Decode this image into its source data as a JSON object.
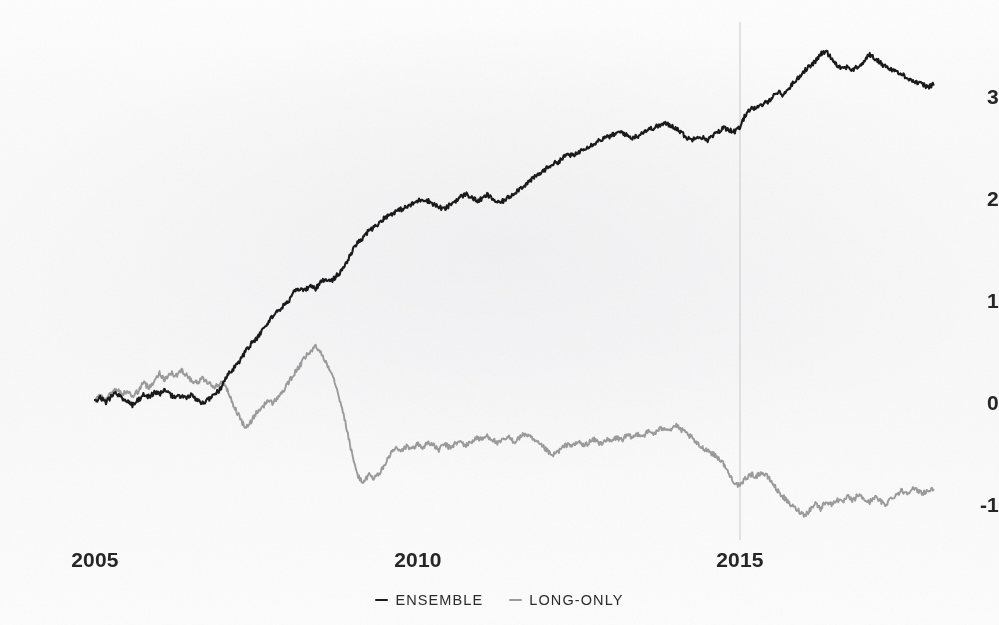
{
  "chart_data": {
    "type": "line",
    "title": "",
    "subtitle": "",
    "xlabel": "",
    "ylabel": "",
    "xlim": [
      2004.85,
      2018.05
    ],
    "ylim": [
      -1.35,
      3.62
    ],
    "grid": false,
    "legend_position": "bottom-center",
    "xticks": [
      2005,
      2010,
      2015
    ],
    "xticklabels": [
      "2005",
      "2010",
      "2015"
    ],
    "yticks": [
      -1,
      0,
      1,
      2,
      3
    ],
    "yticklabels": [
      "-1",
      "0",
      "1",
      "2",
      "3"
    ],
    "annotations": [
      {
        "type": "vline",
        "x": 2015,
        "label": "",
        "color": "#c9c9cf"
      }
    ],
    "colors": {
      "ensemble": "#1a1a1a",
      "long_only": "#9a9a9a",
      "vline": "#c9c9cf",
      "text": "#262626",
      "background": "#fafafa"
    },
    "series": [
      {
        "name": "ENSEMBLE",
        "color": "#1a1a1a",
        "x": [
          2005.0,
          2005.08,
          2005.17,
          2005.25,
          2005.33,
          2005.42,
          2005.5,
          2005.58,
          2005.67,
          2005.75,
          2005.83,
          2005.92,
          2006.0,
          2006.08,
          2006.17,
          2006.25,
          2006.33,
          2006.42,
          2006.5,
          2006.58,
          2006.67,
          2006.75,
          2006.83,
          2006.92,
          2007.0,
          2007.08,
          2007.17,
          2007.25,
          2007.33,
          2007.42,
          2007.5,
          2007.58,
          2007.67,
          2007.75,
          2007.83,
          2007.92,
          2008.0,
          2008.08,
          2008.17,
          2008.25,
          2008.33,
          2008.42,
          2008.5,
          2008.58,
          2008.67,
          2008.75,
          2008.83,
          2008.92,
          2009.0,
          2009.08,
          2009.17,
          2009.25,
          2009.33,
          2009.42,
          2009.5,
          2009.58,
          2009.67,
          2009.75,
          2009.83,
          2009.92,
          2010.0,
          2010.08,
          2010.17,
          2010.25,
          2010.33,
          2010.42,
          2010.5,
          2010.58,
          2010.67,
          2010.75,
          2010.83,
          2010.92,
          2011.0,
          2011.08,
          2011.17,
          2011.25,
          2011.33,
          2011.42,
          2011.5,
          2011.58,
          2011.67,
          2011.75,
          2011.83,
          2011.92,
          2012.0,
          2012.08,
          2012.17,
          2012.25,
          2012.33,
          2012.42,
          2012.5,
          2012.58,
          2012.67,
          2012.75,
          2012.83,
          2012.92,
          2013.0,
          2013.08,
          2013.17,
          2013.25,
          2013.33,
          2013.42,
          2013.5,
          2013.58,
          2013.67,
          2013.75,
          2013.83,
          2013.92,
          2014.0,
          2014.08,
          2014.17,
          2014.25,
          2014.33,
          2014.42,
          2014.5,
          2014.58,
          2014.67,
          2014.75,
          2014.83,
          2014.92,
          2015.0,
          2015.08,
          2015.17,
          2015.25,
          2015.33,
          2015.42,
          2015.5,
          2015.58,
          2015.67,
          2015.75,
          2015.83,
          2015.92,
          2016.0,
          2016.08,
          2016.17,
          2016.25,
          2016.33,
          2016.42,
          2016.5,
          2016.58,
          2016.67,
          2016.75,
          2016.83,
          2016.92,
          2017.0,
          2017.08,
          2017.17,
          2017.25,
          2017.33,
          2017.42,
          2017.5,
          2017.58,
          2017.67,
          2017.75,
          2017.83,
          2017.92,
          2018.0
        ],
        "y": [
          0.02,
          0.05,
          0.01,
          0.06,
          0.1,
          0.05,
          0.02,
          -0.02,
          0.03,
          0.08,
          0.06,
          0.1,
          0.09,
          0.12,
          0.08,
          0.05,
          0.07,
          0.05,
          0.08,
          0.02,
          0.0,
          0.03,
          0.08,
          0.12,
          0.2,
          0.3,
          0.35,
          0.42,
          0.5,
          0.58,
          0.62,
          0.7,
          0.78,
          0.85,
          0.9,
          0.95,
          1.0,
          1.08,
          1.12,
          1.1,
          1.15,
          1.12,
          1.18,
          1.22,
          1.2,
          1.25,
          1.3,
          1.4,
          1.5,
          1.58,
          1.62,
          1.7,
          1.72,
          1.78,
          1.82,
          1.85,
          1.88,
          1.9,
          1.92,
          1.95,
          1.98,
          2.0,
          1.98,
          1.95,
          1.92,
          1.9,
          1.94,
          1.98,
          2.02,
          2.05,
          2.02,
          1.98,
          2.0,
          2.04,
          2.0,
          1.96,
          1.98,
          2.02,
          2.06,
          2.1,
          2.14,
          2.18,
          2.22,
          2.26,
          2.3,
          2.34,
          2.36,
          2.4,
          2.44,
          2.42,
          2.46,
          2.5,
          2.52,
          2.55,
          2.58,
          2.6,
          2.62,
          2.64,
          2.66,
          2.62,
          2.6,
          2.62,
          2.66,
          2.68,
          2.7,
          2.72,
          2.74,
          2.72,
          2.7,
          2.66,
          2.6,
          2.58,
          2.62,
          2.6,
          2.58,
          2.62,
          2.66,
          2.7,
          2.68,
          2.66,
          2.7,
          2.82,
          2.9,
          2.88,
          2.92,
          2.95,
          3.0,
          3.05,
          3.02,
          3.08,
          3.14,
          3.2,
          3.26,
          3.3,
          3.35,
          3.42,
          3.45,
          3.38,
          3.32,
          3.28,
          3.3,
          3.26,
          3.3,
          3.34,
          3.42,
          3.38,
          3.34,
          3.3,
          3.28,
          3.25,
          3.22,
          3.2,
          3.16,
          3.14,
          3.12,
          3.1,
          3.12
        ]
      },
      {
        "name": "LONG-ONLY",
        "color": "#9a9a9a",
        "x": [
          2005.0,
          2005.08,
          2005.17,
          2005.25,
          2005.33,
          2005.42,
          2005.5,
          2005.58,
          2005.67,
          2005.75,
          2005.83,
          2005.92,
          2006.0,
          2006.08,
          2006.17,
          2006.25,
          2006.33,
          2006.42,
          2006.5,
          2006.58,
          2006.67,
          2006.75,
          2006.83,
          2006.92,
          2007.0,
          2007.08,
          2007.17,
          2007.25,
          2007.33,
          2007.42,
          2007.5,
          2007.58,
          2007.67,
          2007.75,
          2007.83,
          2007.92,
          2008.0,
          2008.08,
          2008.17,
          2008.25,
          2008.33,
          2008.42,
          2008.5,
          2008.58,
          2008.67,
          2008.75,
          2008.83,
          2008.92,
          2009.0,
          2009.08,
          2009.17,
          2009.25,
          2009.33,
          2009.42,
          2009.5,
          2009.58,
          2009.67,
          2009.75,
          2009.83,
          2009.92,
          2010.0,
          2010.08,
          2010.17,
          2010.25,
          2010.33,
          2010.42,
          2010.5,
          2010.58,
          2010.67,
          2010.75,
          2010.83,
          2010.92,
          2011.0,
          2011.08,
          2011.17,
          2011.25,
          2011.33,
          2011.42,
          2011.5,
          2011.58,
          2011.67,
          2011.75,
          2011.83,
          2011.92,
          2012.0,
          2012.08,
          2012.17,
          2012.25,
          2012.33,
          2012.42,
          2012.5,
          2012.58,
          2012.67,
          2012.75,
          2012.83,
          2012.92,
          2013.0,
          2013.08,
          2013.17,
          2013.25,
          2013.33,
          2013.42,
          2013.5,
          2013.58,
          2013.67,
          2013.75,
          2013.83,
          2013.92,
          2014.0,
          2014.08,
          2014.17,
          2014.25,
          2014.33,
          2014.42,
          2014.5,
          2014.58,
          2014.67,
          2014.75,
          2014.83,
          2014.92,
          2015.0,
          2015.08,
          2015.17,
          2015.25,
          2015.33,
          2015.42,
          2015.5,
          2015.58,
          2015.67,
          2015.75,
          2015.83,
          2015.92,
          2016.0,
          2016.08,
          2016.17,
          2016.25,
          2016.33,
          2016.42,
          2016.5,
          2016.58,
          2016.67,
          2016.75,
          2016.83,
          2016.92,
          2017.0,
          2017.08,
          2017.17,
          2017.25,
          2017.33,
          2017.42,
          2017.5,
          2017.58,
          2017.67,
          2017.75,
          2017.83,
          2017.92,
          2018.0
        ],
        "y": [
          0.03,
          0.08,
          0.02,
          0.1,
          0.14,
          0.08,
          0.12,
          0.06,
          0.12,
          0.2,
          0.15,
          0.22,
          0.3,
          0.22,
          0.3,
          0.26,
          0.32,
          0.28,
          0.22,
          0.2,
          0.24,
          0.2,
          0.16,
          0.18,
          0.2,
          0.08,
          -0.05,
          -0.15,
          -0.25,
          -0.18,
          -0.1,
          -0.05,
          0.02,
          0.0,
          0.05,
          0.12,
          0.2,
          0.28,
          0.36,
          0.44,
          0.5,
          0.55,
          0.5,
          0.4,
          0.3,
          0.15,
          -0.05,
          -0.3,
          -0.55,
          -0.72,
          -0.78,
          -0.7,
          -0.74,
          -0.68,
          -0.6,
          -0.5,
          -0.44,
          -0.48,
          -0.42,
          -0.45,
          -0.4,
          -0.44,
          -0.38,
          -0.42,
          -0.46,
          -0.4,
          -0.44,
          -0.4,
          -0.38,
          -0.42,
          -0.38,
          -0.34,
          -0.36,
          -0.32,
          -0.36,
          -0.4,
          -0.36,
          -0.34,
          -0.38,
          -0.34,
          -0.3,
          -0.34,
          -0.38,
          -0.42,
          -0.46,
          -0.52,
          -0.48,
          -0.44,
          -0.4,
          -0.42,
          -0.38,
          -0.42,
          -0.38,
          -0.36,
          -0.4,
          -0.36,
          -0.38,
          -0.34,
          -0.36,
          -0.32,
          -0.34,
          -0.3,
          -0.32,
          -0.28,
          -0.3,
          -0.26,
          -0.24,
          -0.26,
          -0.22,
          -0.26,
          -0.3,
          -0.34,
          -0.4,
          -0.44,
          -0.46,
          -0.5,
          -0.54,
          -0.6,
          -0.7,
          -0.78,
          -0.82,
          -0.74,
          -0.7,
          -0.72,
          -0.68,
          -0.72,
          -0.78,
          -0.86,
          -0.92,
          -0.98,
          -1.02,
          -1.06,
          -1.1,
          -1.05,
          -0.98,
          -1.04,
          -0.96,
          -1.0,
          -0.94,
          -0.98,
          -0.92,
          -0.96,
          -0.9,
          -0.94,
          -0.98,
          -0.92,
          -0.96,
          -1.0,
          -0.94,
          -0.9,
          -0.86,
          -0.88,
          -0.84,
          -0.86,
          -0.88,
          -0.86,
          -0.85
        ]
      }
    ]
  },
  "legend": {
    "items": [
      {
        "label": "ENSEMBLE",
        "marker": "dash-marker",
        "color": "#1a1a1a"
      },
      {
        "label": "LONG-ONLY",
        "marker": "dash-marker",
        "color": "#9a9a9a"
      }
    ]
  },
  "axes": {
    "y_labels": [
      "3",
      "2",
      "1",
      "0",
      "-1"
    ],
    "x_labels": [
      "2005",
      "2010",
      "2015"
    ]
  }
}
